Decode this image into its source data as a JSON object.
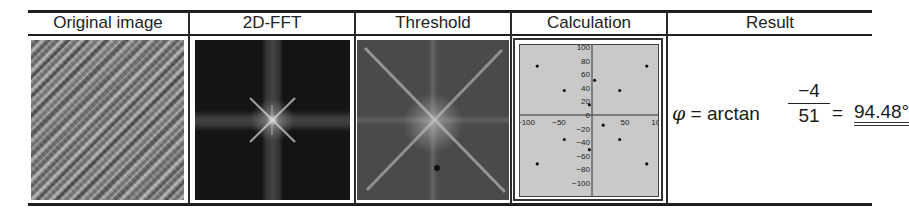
{
  "table": {
    "headers": [
      "Original image",
      "2D-FFT",
      "Threshold",
      "Calculation",
      "Result"
    ],
    "cells": {
      "original_image": "diagonal striped grayscale texture",
      "fft": "dark spectrum with bright central star",
      "threshold": "thresholded spectrum with diagonal X pattern"
    }
  },
  "calculation_plot": {
    "y_ticks": [
      "100",
      "80",
      "60",
      "40",
      "20",
      "0",
      "-20",
      "-40",
      "-60",
      "-80",
      "-100"
    ],
    "x_ticks": [
      "-100",
      "-50",
      "0",
      "50",
      "100"
    ],
    "points": [
      [
        -83,
        72
      ],
      [
        -42,
        36
      ],
      [
        4,
        51
      ],
      [
        42,
        36
      ],
      [
        83,
        72
      ],
      [
        -4,
        15
      ],
      [
        17,
        -15
      ],
      [
        -42,
        -36
      ],
      [
        42,
        -36
      ],
      [
        -4,
        -51
      ],
      [
        -83,
        -72
      ],
      [
        83,
        -72
      ]
    ]
  },
  "result": {
    "symbol": "φ",
    "eq": "=",
    "func": "arctan",
    "numerator": "−4",
    "denominator": "51",
    "eq2": "=",
    "value": "94.48°"
  }
}
